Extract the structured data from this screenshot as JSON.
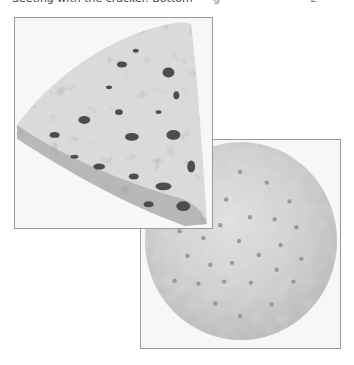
{
  "caption": {
    "text": "Seeting with the cracker. Bottom",
    "fragment_mid": "g",
    "fragment_page": "2"
  },
  "images": [
    {
      "id": "cheese",
      "alt": "wedge of blue cheese",
      "colors": {
        "paste": "#d9d9d9",
        "rind": "#b3b3b3",
        "veins": "#4a4a4a",
        "frame": "#9a9a9a"
      }
    },
    {
      "id": "cracker",
      "alt": "round water cracker with docking holes",
      "colors": {
        "surface": "#cfcfcf",
        "holes": "#8a8a8a",
        "frame": "#9a9a9a"
      }
    }
  ]
}
